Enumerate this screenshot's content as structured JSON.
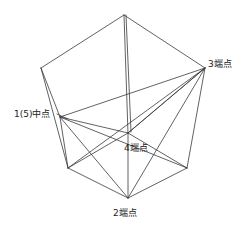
{
  "figure": {
    "background_color": "#ffffff",
    "line_color": "#3a3a3a",
    "width": 248,
    "height": 226
  },
  "labels": {
    "node3": "3端点",
    "node15": "1(5)中点",
    "node4": "4端点",
    "node2": "2端点"
  },
  "diagram_data": {
    "type": "wireframe",
    "vertices": [
      {
        "id": "apex",
        "x": 124,
        "y": 15,
        "label": ""
      },
      {
        "id": "top_left",
        "x": 41,
        "y": 68,
        "label": ""
      },
      {
        "id": "top_right",
        "x": 205,
        "y": 68,
        "label": ""
      },
      {
        "id": "back_top",
        "x": 129,
        "y": 70,
        "label": ""
      },
      {
        "id": "node1",
        "x": 60,
        "y": 117,
        "label": "1(5)中点"
      },
      {
        "id": "node3",
        "x": 205,
        "y": 68,
        "label": "3端点"
      },
      {
        "id": "node4",
        "x": 128,
        "y": 133,
        "label": "4端点"
      },
      {
        "id": "node2",
        "x": 128,
        "y": 198,
        "label": "2端点"
      },
      {
        "id": "bottom_left",
        "x": 68,
        "y": 168,
        "label": ""
      },
      {
        "id": "bottom_right",
        "x": 187,
        "y": 168,
        "label": ""
      }
    ],
    "edges": [
      [
        "apex",
        "top_left"
      ],
      [
        "apex",
        "top_right"
      ],
      [
        "apex",
        "node4"
      ],
      [
        "top_left",
        "node1"
      ],
      [
        "top_right",
        "node4"
      ],
      [
        "node1",
        "node4"
      ],
      [
        "node1",
        "bottom_left"
      ],
      [
        "node1",
        "node2"
      ],
      [
        "node1",
        "node3"
      ],
      [
        "node3",
        "node4"
      ],
      [
        "node3",
        "node2"
      ],
      [
        "node3",
        "bottom_right"
      ],
      [
        "node4",
        "node2"
      ],
      [
        "node4",
        "bottom_left"
      ],
      [
        "node4",
        "bottom_right"
      ],
      [
        "bottom_left",
        "node2"
      ],
      [
        "bottom_right",
        "node2"
      ]
    ]
  }
}
